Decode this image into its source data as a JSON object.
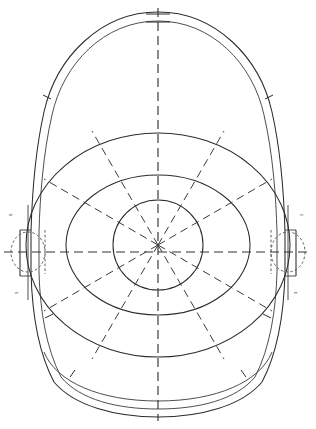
{
  "drawing": {
    "title": "Oval dome plan view",
    "line_color": "#2b2b2b",
    "hidden_line_color": "#555555",
    "center_line_color": "#333333",
    "background_color": "#ffffff",
    "center": {
      "x": 158,
      "y": 245
    },
    "outline": {
      "name": "egg-shaped outer shell",
      "outer_half_width": 152,
      "inner_half_width": 144,
      "top_y": 12,
      "bottom_y": 415,
      "shell_thickness": 8,
      "flat_side_top_y": 232,
      "flat_side_bottom_y": 272
    },
    "rings": [
      {
        "label": "outer ring",
        "radius_x": 132,
        "radius_y": 112
      },
      {
        "label": "middle ring",
        "radius_x": 92,
        "radius_y": 70
      },
      {
        "label": "inner hub circle",
        "radius_x": 45,
        "radius_y": 45
      }
    ],
    "radial_lines": {
      "count": 12,
      "spacing_degrees": 30,
      "style": "dashed centerline"
    },
    "center_lines": {
      "vertical": "full-height dashed centerline",
      "horizontal": "full-width dashed centerline"
    },
    "details": [
      {
        "name": "left nozzle opening",
        "cx": 28,
        "cy": 252,
        "rx": 17,
        "ry": 20,
        "style": "hidden"
      },
      {
        "name": "right nozzle opening",
        "cx": 288,
        "cy": 252,
        "rx": 17,
        "ry": 20,
        "style": "hidden"
      }
    ],
    "edge_marks": {
      "left_upper": "6",
      "left_lower": "5",
      "right_upper": "2",
      "right_lower": "3"
    }
  }
}
